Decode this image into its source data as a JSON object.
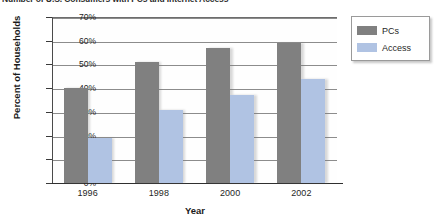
{
  "chart_data": {
    "type": "bar",
    "title": "Number of U.S. Consumers with PCs and Internet Access",
    "xlabel": "Year",
    "ylabel": "Percent of Households",
    "categories": [
      "1996",
      "1998",
      "2000",
      "2002"
    ],
    "series": [
      {
        "name": "PCs",
        "values": [
          40,
          51,
          57,
          59
        ],
        "color": "#808080"
      },
      {
        "name": "Access",
        "values": [
          19,
          31,
          37,
          44
        ],
        "color": "#b0c3e3"
      }
    ],
    "ylim": [
      0,
      70
    ],
    "ytick_values": [
      70,
      60,
      50,
      40,
      30,
      20,
      10,
      0
    ],
    "ytick_labels": [
      "70%",
      "60%",
      "50%",
      "40%",
      "30%",
      "20%",
      "10%",
      "0%"
    ],
    "grid": true,
    "legend_position": "top-right",
    "legend_entries": [
      "PCs",
      "Access"
    ]
  },
  "axes": {
    "y_title": "Percent of Households",
    "x_title": "Year"
  },
  "legend": {
    "items": [
      {
        "label": "PCs"
      },
      {
        "label": "Access"
      }
    ]
  }
}
